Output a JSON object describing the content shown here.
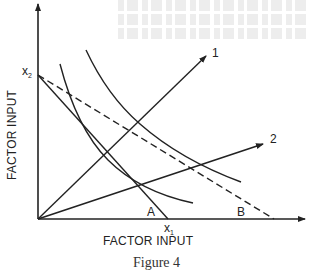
{
  "diagram": {
    "type": "isoquant-diagram",
    "axes": {
      "x_title": "FACTOR INPUT",
      "y_title": "FACTOR INPUT"
    },
    "point_labels": {
      "x2": "x",
      "x2_sub": "2",
      "x1": "x",
      "x1_sub": "1",
      "A": "A",
      "B": "B"
    },
    "rays": [
      {
        "id": "1",
        "label": "1"
      },
      {
        "id": "2",
        "label": "2"
      }
    ],
    "curves": [
      {
        "id": "inner-isoquant",
        "style": "solid"
      },
      {
        "id": "outer-isoquant",
        "style": "solid"
      },
      {
        "id": "budget-line-A",
        "style": "solid",
        "from": "x2",
        "to": "x1"
      },
      {
        "id": "budget-line-B",
        "style": "dashed",
        "from": "x2",
        "to": "B"
      }
    ],
    "colors": {
      "ink": "#222222",
      "background": "#ffffff"
    },
    "caption": "Figure 4"
  }
}
